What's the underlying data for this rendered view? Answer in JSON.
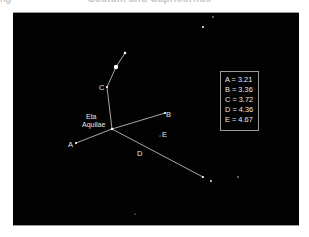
{
  "header": {
    "left_fragment": "ng",
    "title": "Scutum and Capricornus"
  },
  "diagram": {
    "background": "#020202",
    "line_color": "#cfcfcf",
    "star_color": "#ffffff",
    "labels": {
      "A": "A",
      "B": "B",
      "C": "C",
      "D": "D",
      "E": "E",
      "eta_line1": "Eta",
      "eta_line2": "Aquilae"
    },
    "legend": [
      {
        "key": "A",
        "text": "A = 3.21"
      },
      {
        "key": "B",
        "text": "B = 3.36"
      },
      {
        "key": "C",
        "text": "C = 3.72"
      },
      {
        "key": "D",
        "text": "D = 4.36"
      },
      {
        "key": "E",
        "text": "E = 4.67"
      }
    ]
  }
}
